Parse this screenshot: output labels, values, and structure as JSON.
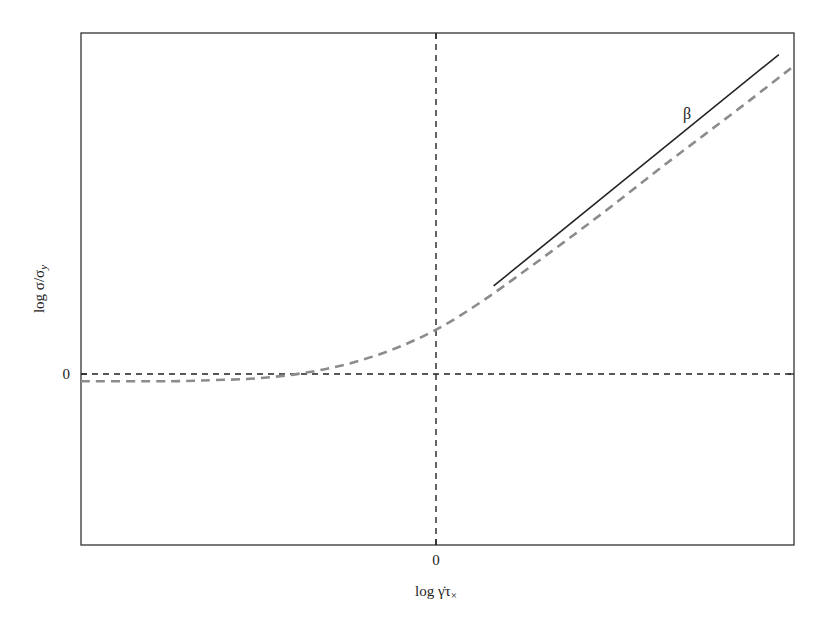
{
  "chart_data": {
    "type": "line",
    "title": "",
    "xlabel": "log γ̇τ×",
    "ylabel": "log σ/σy",
    "xlabel_parts": {
      "main": "log ",
      "gamma_dot": "γ̇",
      "tau": "τ",
      "sub": "×"
    },
    "ylabel_parts": {
      "main": "log σ/σ",
      "sub": "y"
    },
    "x_ticks": [
      "0"
    ],
    "y_ticks": [
      "0"
    ],
    "xlim": [
      -4,
      4
    ],
    "ylim": [
      -1.6,
      3.4
    ],
    "grid": false,
    "reference_lines": [
      {
        "orientation": "vertical",
        "x": 0,
        "style": "dashed",
        "color": "#222222"
      },
      {
        "orientation": "horizontal",
        "y": 0,
        "style": "dashed",
        "color": "#222222"
      }
    ],
    "series": [
      {
        "name": "flow curve",
        "style": "dashed",
        "color": "#8c8c8c",
        "x": [
          -4.0,
          -3.0,
          -2.5,
          -2.0,
          -1.5,
          -1.0,
          -0.5,
          0.0,
          0.5,
          1.0,
          1.5,
          2.0,
          2.5,
          3.0,
          3.5,
          4.0
        ],
        "y": [
          0.0,
          0.0,
          0.01,
          0.03,
          0.08,
          0.17,
          0.31,
          0.51,
          0.78,
          1.09,
          1.41,
          1.74,
          2.08,
          2.41,
          2.74,
          3.08
        ]
      },
      {
        "name": "power-law slope β",
        "style": "solid",
        "color": "#222222",
        "x": [
          0.63,
          3.83
        ],
        "y": [
          0.93,
          3.19
        ]
      }
    ],
    "annotations": [
      {
        "text": "β",
        "x": 2.8,
        "y": 2.62
      }
    ]
  }
}
